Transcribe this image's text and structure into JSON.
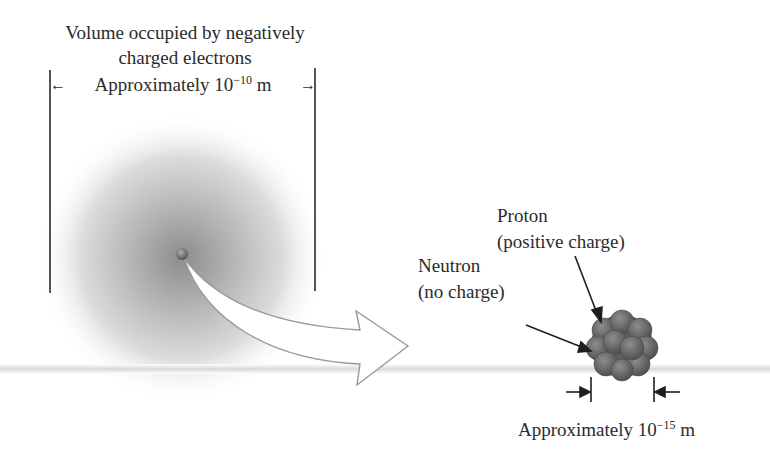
{
  "atom": {
    "title_line1": "Volume occupied by negatively",
    "title_line2": "charged electrons",
    "size_label_prefix": "Approximately 10",
    "size_label_exponent": "−10",
    "size_label_unit": "m"
  },
  "nucleus": {
    "proton_label": "Proton",
    "proton_desc": "(positive charge)",
    "neutron_label": "Neutron",
    "neutron_desc": "(no charge)",
    "size_label_prefix": "Approximately 10",
    "size_label_exponent": "−15",
    "size_label_unit": "m"
  },
  "colors": {
    "cloud_center": "#8a8a8a",
    "nucleus_fill": "#6e6e6e",
    "line": "#2a2a2a"
  }
}
